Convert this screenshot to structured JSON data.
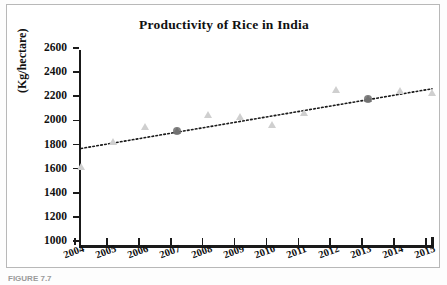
{
  "chart_data": {
    "type": "scatter",
    "title": "Productivity of Rice in India",
    "xlabel": "",
    "ylabel": "(Kg/hectare)",
    "ylim": [
      1000,
      2600
    ],
    "ytick_step": 200,
    "ytick_labels": [
      "2600",
      "2400",
      "2200",
      "2000",
      "1800",
      "1600",
      "1400",
      "1200",
      "1000"
    ],
    "ytick_values": [
      2600,
      2400,
      2200,
      2000,
      1800,
      1600,
      1400,
      1200,
      1000
    ],
    "categories": [
      "2004",
      "2005",
      "2006",
      "2007",
      "2008",
      "2009",
      "2010",
      "2011",
      "2012",
      "2013",
      "2014",
      "2015"
    ],
    "x": [
      2004,
      2005,
      2006,
      2007,
      2008,
      2009,
      2010,
      2011,
      2012,
      2013,
      2014,
      2015
    ],
    "values": [
      1650,
      1860,
      1980,
      1945,
      2080,
      2060,
      2000,
      2100,
      2285,
      2210,
      2280,
      2265
    ],
    "series": [
      {
        "name": "Productivity",
        "marker": "triangle",
        "color": "#cfcfcf",
        "values": [
          1650,
          1860,
          1980,
          1945,
          2080,
          2060,
          2000,
          2100,
          2285,
          2210,
          2280,
          2265
        ]
      }
    ],
    "highlighted_points": [
      {
        "x": 2007,
        "y": 1945
      },
      {
        "x": 2013,
        "y": 2210
      }
    ],
    "trendline": {
      "type": "linear",
      "style": "dotted",
      "color": "#1a1a1a",
      "x_start": 2004,
      "y_start": 1800,
      "x_end": 2015,
      "y_end": 2295
    },
    "grid": false,
    "legend": false,
    "xtick_rotation": -20
  },
  "caption": {
    "text": "FIGURE 7.7"
  }
}
